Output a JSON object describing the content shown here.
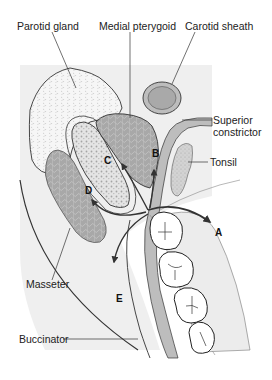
{
  "labels": {
    "parotid_gland": "Parotid gland",
    "medial_pterygoid": "Medial pterygoid",
    "carotid_sheath": "Carotid sheath",
    "superior_constrictor_line1": "Superior",
    "superior_constrictor_line2": "constrictor",
    "tonsil": "Tonsil",
    "masseter": "Masseter",
    "buccinator": "Buccinator"
  },
  "arrows": {
    "a": "A",
    "b": "B",
    "c": "C",
    "d": "D",
    "e": "E"
  },
  "colors": {
    "background_panel": "#efefef",
    "muscle": "#a9a9a9",
    "gland": "#f4f4f4",
    "bone": "#e6e6e6",
    "constrictor": "#bdbdbd",
    "outline": "#333333",
    "tooth": "#ffffff"
  }
}
